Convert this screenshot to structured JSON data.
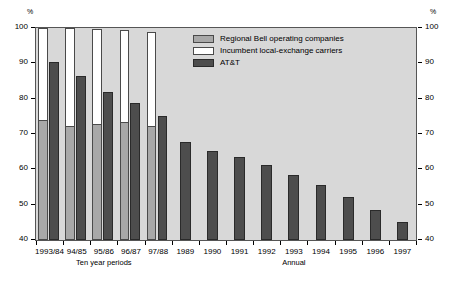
{
  "chart_data": {
    "type": "bar",
    "title": "",
    "subtitle": "",
    "xlabel": "",
    "ylabel": "%",
    "ylabel_right": "%",
    "ylim": [
      40,
      100
    ],
    "yticks": [
      40,
      50,
      60,
      70,
      80,
      90,
      100
    ],
    "ytick_labels": [
      "40",
      "50",
      "60",
      "70",
      "80",
      "90",
      "100"
    ],
    "grid": false,
    "legend_position": "upper-center",
    "categories": [
      "1993/84",
      "94/85",
      "95/86",
      "96/87",
      "97/88",
      "1989",
      "1990",
      "1991",
      "1992",
      "1993",
      "1994",
      "1995",
      "1996",
      "1997"
    ],
    "x_group_captions": [
      {
        "label": "Ten year periods",
        "spans": [
          "1993/84",
          "97/88"
        ]
      },
      {
        "label": "Annual",
        "spans": [
          "1989",
          "1997"
        ]
      }
    ],
    "series": [
      {
        "name": "Regional Bell operating companies",
        "color": "#a8a8a8",
        "values": [
          74.0,
          72.3,
          72.7,
          73.4,
          72.2,
          null,
          null,
          null,
          null,
          null,
          null,
          null,
          null,
          null
        ]
      },
      {
        "name": "Incumbent local-exchange carriers",
        "color": "#ffffff",
        "values": [
          26.0,
          27.7,
          27.3,
          26.6,
          27.8,
          null,
          null,
          null,
          null,
          null,
          null,
          null,
          null,
          null
        ],
        "stack_totals": [
          100.0,
          100.0,
          99.7,
          99.5,
          98.9,
          null,
          null,
          null,
          null,
          null,
          null,
          null,
          null,
          null
        ]
      },
      {
        "name": "AT&T",
        "color": "#4d4d4d",
        "values": [
          90.3,
          86.4,
          82.0,
          78.9,
          75.0,
          67.8,
          65.3,
          63.5,
          61.1,
          58.5,
          55.6,
          52.3,
          48.4,
          45.0
        ]
      }
    ]
  },
  "axes": {
    "unit_left": "%",
    "unit_right": "%"
  },
  "legend": {
    "items": [
      {
        "label": "Regional Bell operating companies",
        "swatch": "rboc-swatch"
      },
      {
        "label": "Incumbent local-exchange carriers",
        "swatch": "ilec-swatch"
      },
      {
        "label": "AT&T",
        "swatch": "att-swatch"
      }
    ]
  }
}
